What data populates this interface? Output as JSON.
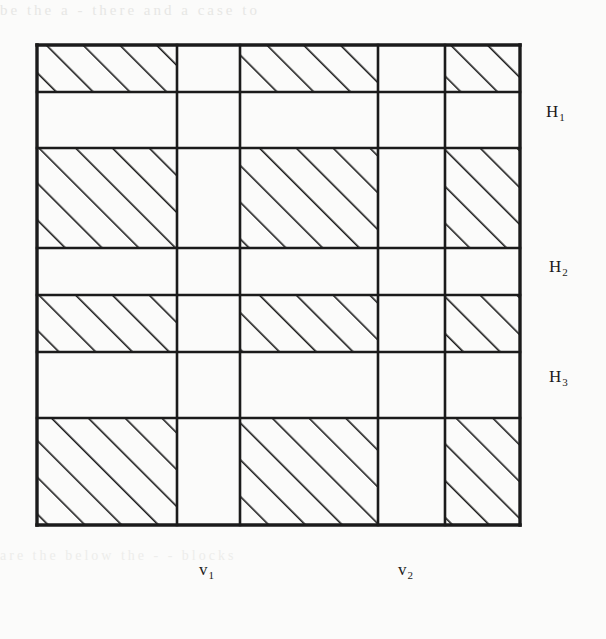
{
  "figure": {
    "kind": "hatched-grid-diagram",
    "colors": {
      "ink": "#1b1b1b",
      "paper": "#fbfbfa",
      "hatch": "#1b1b1b"
    },
    "frame": {
      "left": 37,
      "top": 45,
      "right": 520,
      "bottom": 525
    },
    "hatch": {
      "angle_deg": 45,
      "direction": "lower-left to upper-right",
      "spacing_px": 26,
      "stroke_width": 3.2
    },
    "vertical_lines_x": [
      37,
      177,
      240,
      378,
      445,
      520
    ],
    "horizontal_lines_y": [
      45,
      92,
      148,
      248,
      295,
      352,
      418,
      525
    ],
    "columns": [
      {
        "index": 0,
        "x0": 37,
        "x1": 177,
        "shaded": true
      },
      {
        "index": 1,
        "x0": 177,
        "x1": 240,
        "shaded": false
      },
      {
        "index": 2,
        "x0": 240,
        "x1": 378,
        "shaded": true
      },
      {
        "index": 3,
        "x0": 378,
        "x1": 445,
        "shaded": false
      },
      {
        "index": 4,
        "x0": 445,
        "x1": 520,
        "shaded": true
      }
    ],
    "rows": [
      {
        "index": 0,
        "y0": 45,
        "y1": 92,
        "shaded": true
      },
      {
        "index": 1,
        "y0": 92,
        "y1": 148,
        "shaded": false
      },
      {
        "index": 2,
        "y0": 148,
        "y1": 248,
        "shaded": true
      },
      {
        "index": 3,
        "y0": 248,
        "y1": 295,
        "shaded": false
      },
      {
        "index": 4,
        "y0": 295,
        "y1": 352,
        "shaded": true
      },
      {
        "index": 5,
        "y0": 352,
        "y1": 418,
        "shaded": false
      },
      {
        "index": 6,
        "y0": 418,
        "y1": 525,
        "shaded": true
      }
    ],
    "cell_hatched_matrix": [
      [
        true,
        false,
        true,
        false,
        true
      ],
      [
        false,
        false,
        false,
        false,
        false
      ],
      [
        true,
        false,
        true,
        false,
        true
      ],
      [
        false,
        false,
        false,
        false,
        false
      ],
      [
        true,
        false,
        true,
        false,
        true
      ],
      [
        false,
        false,
        false,
        false,
        false
      ],
      [
        true,
        false,
        true,
        false,
        true
      ]
    ]
  },
  "labels": {
    "horizontal": [
      {
        "id": "H1",
        "text": "H",
        "sub": "1",
        "x": 546,
        "y": 103
      },
      {
        "id": "H2",
        "text": "H",
        "sub": "2",
        "x": 549,
        "y": 258
      },
      {
        "id": "H3",
        "text": "H",
        "sub": "3",
        "x": 549,
        "y": 368
      }
    ],
    "vertical": [
      {
        "id": "V1",
        "text": "v",
        "sub": "1",
        "x": 199,
        "y": 561
      },
      {
        "id": "V2",
        "text": "v",
        "sub": "2",
        "x": 398,
        "y": 561
      }
    ]
  },
  "bleed_through": {
    "top": "be  the   a  -  there   and  a case  to",
    "bottom": "are  the  below   the      -  -      blocks"
  }
}
